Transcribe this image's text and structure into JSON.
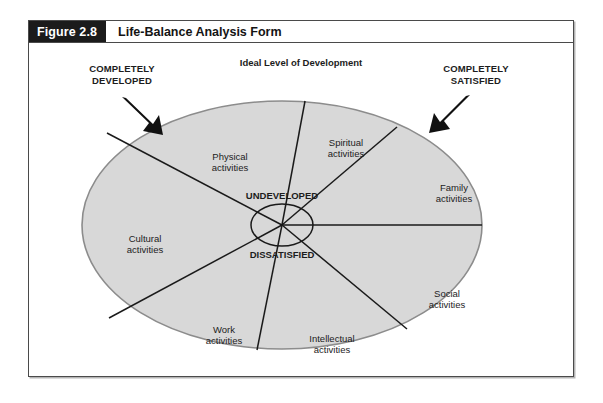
{
  "figure": {
    "number": "Figure 2.8",
    "title": "Life-Balance Analysis Form"
  },
  "diagram": {
    "top_heading": "Ideal Level of Development",
    "callouts": [
      {
        "line1": "COMPLETELY",
        "line2": "DEVELOPED"
      },
      {
        "line1": "COMPLETELY",
        "line2": "SATISFIED"
      }
    ],
    "center_labels": {
      "top": "UNDEVELOPED",
      "bottom": "DISSATISFIED"
    },
    "segments": [
      {
        "line1": "Physical",
        "line2": "activities"
      },
      {
        "line1": "Spiritual",
        "line2": "activities"
      },
      {
        "line1": "Family",
        "line2": "activities"
      },
      {
        "line1": "Social",
        "line2": "activities"
      },
      {
        "line1": "Intellectual",
        "line2": "activities"
      },
      {
        "line1": "Work",
        "line2": "activities"
      },
      {
        "line1": "Cultural",
        "line2": "activities"
      }
    ],
    "colors": {
      "ellipse_fill": "#d8d8d8",
      "ellipse_stroke": "#8c8c8c",
      "spoke_stroke": "#1a1a1a",
      "header_bg": "#1b1b1b",
      "frame_border": "#4a4a4a",
      "text": "#1c1c1c"
    }
  }
}
